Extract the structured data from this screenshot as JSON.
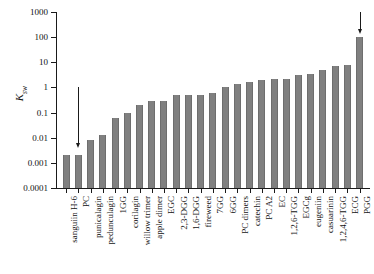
{
  "chart_data": {
    "type": "bar",
    "title": "",
    "subtitle": "",
    "xlabel": "",
    "ylabel": "Ksw",
    "ylabel_base": "K",
    "ylabel_sub": "sw",
    "yscale": "log",
    "ylim": [
      0.0001,
      1000
    ],
    "ytick_labels": [
      "1000",
      "100",
      "10",
      "1",
      "0.1",
      "0.01",
      "0.001",
      "0.0001"
    ],
    "ytick_values": [
      1000,
      100,
      10,
      1,
      0.1,
      0.01,
      0.001,
      0.0001
    ],
    "grid": false,
    "legend": "none",
    "bar_color": "#808080",
    "axis_color": "#1a1a1a",
    "categories": [
      "sanguiin H-6",
      "PC",
      "punicalagin",
      "pedunculagin",
      "1GG",
      "corilagin",
      "willow trimer",
      "apple dimer",
      "EGC",
      "2,3-DGG",
      "1,6-DGG",
      "fireweed",
      "7GG",
      "6GG",
      "PC dimers",
      "catechin",
      "PC A2",
      "EC",
      "1,2,6-TGG",
      "EGCg",
      "eugeniin",
      "casuarinin",
      "1,2,4,6-TGG",
      "ECG",
      "PGG"
    ],
    "values": [
      0.002,
      0.002,
      0.008,
      0.013,
      0.06,
      0.1,
      0.2,
      0.3,
      0.3,
      0.5,
      0.5,
      0.5,
      0.6,
      1.0,
      1.4,
      1.7,
      2.0,
      2.1,
      2.2,
      3.0,
      3.5,
      5.0,
      7.0,
      8.0,
      100.0
    ],
    "annotations": [
      {
        "name": "down-arrow-left",
        "target_category": "PC",
        "from_value": 1,
        "to_value": 0.004,
        "direction": "down"
      },
      {
        "name": "down-arrow-right",
        "target_category": "PGG",
        "from_value": 1000,
        "to_value": 130,
        "direction": "down"
      }
    ]
  }
}
